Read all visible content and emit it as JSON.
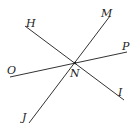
{
  "diagram": {
    "type": "intersecting-lines",
    "intersection_point": {
      "label": "N",
      "x": 75,
      "y": 63
    },
    "lines": [
      {
        "name": "line-HI",
        "from": {
          "label": "H",
          "x": 25,
          "y": 26
        },
        "to": {
          "label": "I",
          "x": 124,
          "y": 100
        }
      },
      {
        "name": "line-MJ",
        "from": {
          "label": "M",
          "x": 110,
          "y": 16
        },
        "to": {
          "label": "J",
          "x": 29,
          "y": 123
        }
      },
      {
        "name": "line-OP",
        "from": {
          "label": "O",
          "x": 10,
          "y": 77
        },
        "to": {
          "label": "P",
          "x": 127,
          "y": 52
        }
      }
    ],
    "labels": {
      "H": "H",
      "M": "M",
      "P": "P",
      "O": "O",
      "N": "N",
      "I": "I",
      "J": "J"
    },
    "colors": {
      "line": "#333333",
      "text": "#222222",
      "background": "#ffffff"
    }
  }
}
